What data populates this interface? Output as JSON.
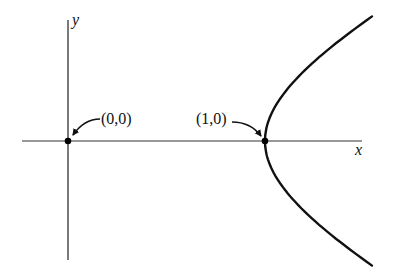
{
  "figure": {
    "axes": {
      "x_label": "x",
      "y_label": "y",
      "color": "#111111"
    },
    "points": [
      {
        "name": "origin",
        "label": "(0,0)",
        "x": 0,
        "y": 0
      },
      {
        "name": "vertex",
        "label": "(1,0)",
        "x": 1,
        "y": 0
      }
    ],
    "curve": {
      "equation": "x^2 - y^2 = 1",
      "branch": "right",
      "t_range": [
        -1.0,
        1.0
      ],
      "color": "#111111"
    }
  },
  "layout": {
    "origin_px": [
      68,
      141
    ],
    "scale_x": 197,
    "scale_y": 106
  }
}
